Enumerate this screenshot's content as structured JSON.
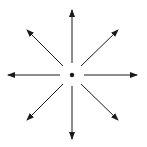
{
  "diagram": {
    "center": {
      "x": 72,
      "y": 75,
      "r": 2.2
    },
    "color": "#1a1a1a",
    "background": "#ffffff",
    "arrows": [
      {
        "direction": "up",
        "x1": 72,
        "y1": 63,
        "x2": 72,
        "y2": 10
      },
      {
        "direction": "up-right",
        "x1": 81,
        "y1": 66,
        "x2": 118,
        "y2": 30
      },
      {
        "direction": "right",
        "x1": 84,
        "y1": 75,
        "x2": 137,
        "y2": 75
      },
      {
        "direction": "down-right",
        "x1": 81,
        "y1": 84,
        "x2": 118,
        "y2": 120
      },
      {
        "direction": "down",
        "x1": 72,
        "y1": 86,
        "x2": 72,
        "y2": 139
      },
      {
        "direction": "down-left",
        "x1": 63,
        "y1": 84,
        "x2": 27,
        "y2": 120
      },
      {
        "direction": "left",
        "x1": 60,
        "y1": 75,
        "x2": 8,
        "y2": 75
      },
      {
        "direction": "up-left",
        "x1": 63,
        "y1": 66,
        "x2": 27,
        "y2": 30
      }
    ]
  }
}
